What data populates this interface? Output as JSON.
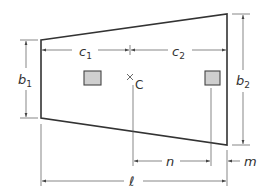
{
  "diagram": {
    "colors": {
      "outline": "#333333",
      "dimension": "#555555",
      "column_fill": "#cfcfcf",
      "text": "#333333"
    },
    "labels": {
      "c1": {
        "base": "c",
        "sub": "1"
      },
      "c2": {
        "base": "c",
        "sub": "2"
      },
      "b1": {
        "base": "b",
        "sub": "1"
      },
      "b2": {
        "base": "b",
        "sub": "2"
      },
      "center": "C",
      "n": "n",
      "m": "m",
      "length": "ℓ"
    },
    "elements": [
      "trapezoid-footing",
      "column-left",
      "column-right",
      "centroid-marker"
    ]
  }
}
